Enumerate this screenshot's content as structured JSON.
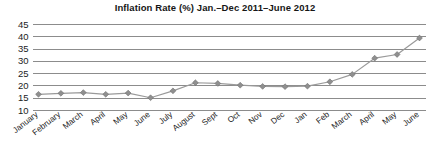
{
  "chart_data": {
    "type": "line",
    "title": "Inflation Rate (%)  Jan.–Dec 2011–June 2012",
    "xlabel": "",
    "ylabel": "",
    "ylim": [
      10,
      45
    ],
    "ytick_step": 5,
    "yticks": [
      "45",
      "40",
      "35",
      "30",
      "25",
      "20",
      "15",
      "10"
    ],
    "grid": true,
    "legend": "none",
    "marker": "diamond",
    "series_color": "#8f8f8f",
    "gridline_color": "#8c8c8c",
    "categories": [
      "January",
      "February",
      "March",
      "April",
      "May",
      "June",
      "July",
      "August",
      "Sept",
      "Oct",
      "Nov",
      "Dec",
      "Jan",
      "Feb",
      "March",
      "April",
      "May",
      "June"
    ],
    "series": [
      {
        "name": "Inflation Rate (%)",
        "values": [
          16.6,
          17.0,
          17.3,
          16.6,
          17.1,
          15.2,
          18.0,
          21.3,
          21.0,
          20.3,
          19.8,
          19.7,
          19.9,
          21.7,
          24.7,
          31.3,
          32.8,
          39.5
        ]
      }
    ]
  }
}
